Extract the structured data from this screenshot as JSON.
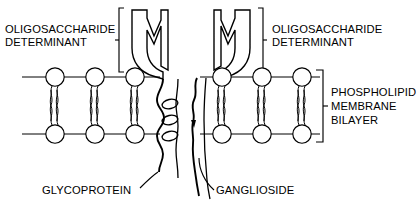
{
  "figure": {
    "background_color": "#ffffff",
    "ink_color": "#000000"
  },
  "labels": {
    "oligo_left_line1": "OLIGOSACCHARIDE",
    "oligo_left_line2": "DETERMINANT",
    "oligo_right_line1": "OLIGOSACCHARIDE",
    "oligo_right_line2": "DETERMINANT",
    "membrane_line1": "PHOSPHOLIPID",
    "membrane_line2": "MEMBRANE",
    "membrane_line3": "BILAYER",
    "glycoprotein": "GLYCOPROTEIN",
    "ganglioside": "GANGLIOSIDE"
  },
  "structures": {
    "oligosaccharide_determinant_count": 2,
    "glycoprotein": {
      "name": "glycoprotein",
      "transmembrane_style": "coiled-helix",
      "coil_loops": 3
    },
    "ganglioside": {
      "name": "ganglioside",
      "transmembrane_style": "wavy-single-chain"
    }
  },
  "membrane": {
    "leaflets": 2,
    "phospholipids_per_leaflet_left": 3,
    "phospholipids_per_leaflet_right": 3,
    "tails_per_phospholipid": 2,
    "head_shape": "circle"
  },
  "brackets": [
    {
      "name": "oligosaccharide-left-bracket",
      "orientation": "right-facing"
    },
    {
      "name": "oligosaccharide-right-bracket",
      "orientation": "left-facing"
    },
    {
      "name": "membrane-bracket",
      "orientation": "left-facing"
    }
  ],
  "pointers": [
    {
      "name": "glycoprotein-pointer",
      "from": "GLYCOPROTEIN",
      "to": "glycoprotein tail"
    },
    {
      "name": "ganglioside-pointer",
      "from": "GANGLIOSIDE",
      "to": "ganglioside tail"
    }
  ]
}
